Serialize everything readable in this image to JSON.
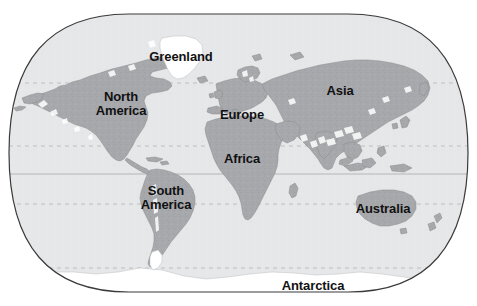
{
  "map": {
    "title": "World Map",
    "projection": "robinson",
    "colors": {
      "background": "#ffffff",
      "ocean": "#e6e7e8",
      "land": "#a7a9ac",
      "ice": "#ffffff",
      "outline": "#3a3a3a",
      "graticule": "#b9babc",
      "coastline": "#8a8c8f",
      "label_text": "#111111"
    },
    "frame": {
      "left": 9,
      "top": 14,
      "right": 468,
      "bottom": 292,
      "corner_radius": 120
    },
    "labels": [
      {
        "name": "greenland",
        "text": "Greenland",
        "x": 181,
        "y": 57,
        "size": 13
      },
      {
        "name": "north-america",
        "text": "North\nAmerica",
        "x": 121,
        "y": 103,
        "size": 13
      },
      {
        "name": "europe",
        "text": "Europe",
        "x": 242,
        "y": 115,
        "size": 13
      },
      {
        "name": "asia",
        "text": "Asia",
        "x": 340,
        "y": 91,
        "size": 13
      },
      {
        "name": "africa",
        "text": "Africa",
        "x": 242,
        "y": 159,
        "size": 13
      },
      {
        "name": "south-america",
        "text": "South\nAmerica",
        "x": 166,
        "y": 197,
        "size": 13
      },
      {
        "name": "australia",
        "text": "Australia",
        "x": 383,
        "y": 209,
        "size": 13
      },
      {
        "name": "antarctica",
        "text": "Antarctica",
        "x": 313,
        "y": 286,
        "size": 13
      }
    ],
    "graticule": [
      {
        "name": "arctic-circle",
        "label": "Arctic Circle",
        "y": 83,
        "style": "dashed"
      },
      {
        "name": "tropic-of-cancer",
        "label": "Tropic of Cancer",
        "y": 146,
        "style": "dashed"
      },
      {
        "name": "equator",
        "label": "Equator",
        "y": 174,
        "style": "solid"
      },
      {
        "name": "tropic-of-capricorn",
        "label": "Tropic of Capricorn",
        "y": 204,
        "style": "dashed"
      },
      {
        "name": "antarctic-circle",
        "label": "Antarctic Circle",
        "y": 268,
        "style": "dashed"
      }
    ]
  }
}
